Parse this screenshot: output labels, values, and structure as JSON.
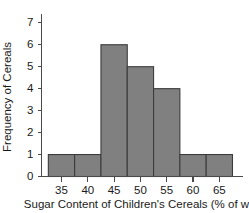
{
  "chart_data": {
    "type": "bar",
    "title": "",
    "subtitle": "",
    "xlabel": "Sugar Content of Children's Cereals (% of wt)",
    "ylabel": "Frequency of Cereals",
    "categories": [
      "35",
      "40",
      "45",
      "50",
      "55",
      "60",
      "65"
    ],
    "values": [
      1,
      1,
      6,
      5,
      4,
      1,
      1
    ],
    "bin_edges": [
      32.5,
      37.5,
      42.5,
      47.5,
      52.5,
      57.5,
      62.5,
      67.5
    ],
    "bin_width": 5,
    "x_tick_labels": [
      "35",
      "40",
      "45",
      "50",
      "55",
      "60",
      "65"
    ],
    "x_tick_values": [
      35,
      40,
      45,
      50,
      55,
      60,
      65
    ],
    "y_tick_labels": [
      "0",
      "1",
      "2",
      "3",
      "4",
      "5",
      "6",
      "7"
    ],
    "y_tick_values": [
      0,
      1,
      2,
      3,
      4,
      5,
      6,
      7
    ],
    "xlim": [
      31.2,
      69.5
    ],
    "ylim": [
      0,
      7.4
    ],
    "grid": false,
    "legend": null,
    "legend_position": "none",
    "bar_fill_color": "#808080",
    "bar_edge_color": "#3c3c3c",
    "axis_color": "#4a4a4a",
    "text_color": "#1a1a1a",
    "background_color": "#ffffff",
    "annotations": []
  }
}
